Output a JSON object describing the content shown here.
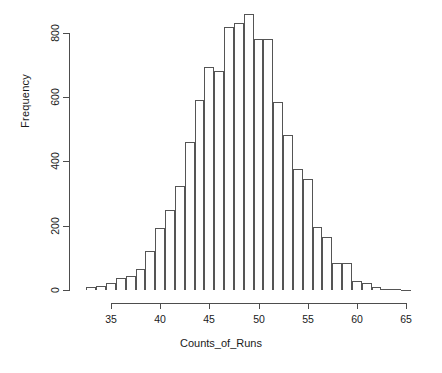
{
  "chart_data": {
    "type": "bar",
    "title": "",
    "subtitle": "",
    "xlabel": "Counts_of_Runs",
    "ylabel": "Frequency",
    "grid": false,
    "legend": "none",
    "xlim": [
      32,
      66
    ],
    "ylim": [
      0,
      860
    ],
    "xticks": [
      35,
      40,
      45,
      50,
      55,
      60,
      65
    ],
    "yticks": [
      0,
      200,
      400,
      600,
      800
    ],
    "bin_width": 1,
    "categories": [
      33,
      34,
      35,
      36,
      37,
      38,
      39,
      40,
      41,
      42,
      43,
      44,
      45,
      46,
      47,
      48,
      49,
      50,
      51,
      52,
      53,
      54,
      55,
      56,
      57,
      58,
      59,
      60,
      61,
      62,
      63,
      64,
      65
    ],
    "values": [
      8,
      14,
      22,
      36,
      44,
      65,
      120,
      193,
      248,
      323,
      462,
      592,
      695,
      682,
      820,
      832,
      860,
      782,
      782,
      586,
      484,
      376,
      344,
      197,
      166,
      83,
      84,
      29,
      22,
      8,
      4,
      2,
      1
    ]
  },
  "axis": {
    "ylabel_text": "Frequency",
    "xlabel_text": "Counts_of_Runs",
    "ytick_labels": [
      "0",
      "200",
      "400",
      "600",
      "800"
    ],
    "xtick_labels": [
      "35",
      "40",
      "45",
      "50",
      "55",
      "60",
      "65"
    ]
  },
  "style": {
    "bar_stroke": "#555555",
    "bar_fill": "#ffffff",
    "axis_color": "#4d4d4d",
    "text_color": "#1a1a1a",
    "background": "#ffffff"
  }
}
